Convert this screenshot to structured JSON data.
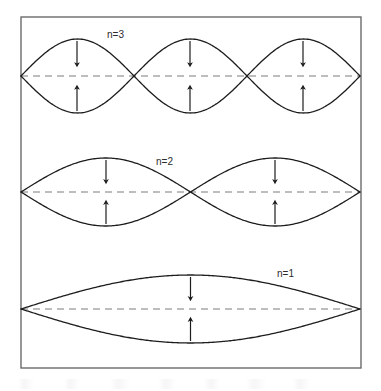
{
  "figure": {
    "frame": {
      "x": 21,
      "y": 17,
      "width": 340,
      "height": 351,
      "stroke": "#6b6b6b",
      "stroke_width": 1.4,
      "fill": "#ffffff"
    },
    "style": {
      "wave_stroke": "#1d1d1d",
      "wave_stroke_width": 1.3,
      "axis_stroke": "#7d7d7d",
      "axis_dash": "7 5",
      "axis_stroke_width": 1.2,
      "arrow_stroke": "#1d1d1d",
      "arrow_stroke_width": 1.2,
      "label_color": "#2b2b2b",
      "label_font_size": 10
    }
  },
  "chart_data": {
    "type": "line",
    "xlabel": "",
    "ylabel": "",
    "x_range": [
      21,
      360
    ],
    "grid": false,
    "legend": "inline-labels",
    "series": [
      {
        "name": "n=3",
        "label": "n=3",
        "harmonic": 3,
        "half_wavelengths": 3,
        "axis_y": 76,
        "amplitude": 37,
        "node_x": [
          21,
          134,
          247,
          360
        ],
        "antinode_x": [
          77,
          190,
          303
        ],
        "label_x": 107,
        "label_y": 38,
        "arrows": [
          {
            "x": 77,
            "direction": "down"
          },
          {
            "x": 190,
            "direction": "down"
          },
          {
            "x": 303,
            "direction": "down"
          },
          {
            "x": 77,
            "direction": "up"
          },
          {
            "x": 190,
            "direction": "up"
          },
          {
            "x": 303,
            "direction": "up"
          }
        ]
      },
      {
        "name": "n=2",
        "label": "n=2",
        "harmonic": 2,
        "half_wavelengths": 2,
        "axis_y": 192,
        "amplitude": 34,
        "node_x": [
          21,
          190.5,
          360
        ],
        "antinode_x": [
          106,
          275
        ],
        "label_x": 156,
        "label_y": 165,
        "arrows": [
          {
            "x": 106,
            "direction": "down"
          },
          {
            "x": 275,
            "direction": "down"
          },
          {
            "x": 106,
            "direction": "up"
          },
          {
            "x": 275,
            "direction": "up"
          }
        ]
      },
      {
        "name": "n=1",
        "label": "n=1",
        "harmonic": 1,
        "half_wavelengths": 1,
        "axis_y": 309,
        "amplitude": 34,
        "node_x": [
          21,
          360
        ],
        "antinode_x": [
          190.5
        ],
        "label_x": 277,
        "label_y": 277,
        "arrows": [
          {
            "x": 190.5,
            "direction": "down"
          },
          {
            "x": 190.5,
            "direction": "up"
          }
        ]
      }
    ]
  }
}
